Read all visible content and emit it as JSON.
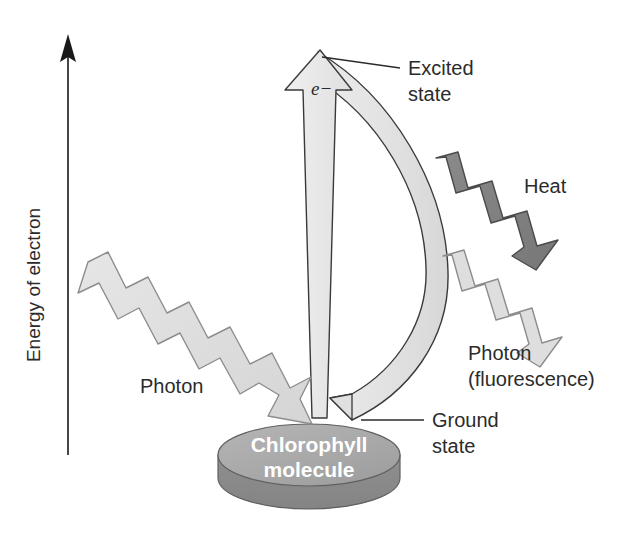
{
  "diagram": {
    "axis": {
      "label": "Energy of electron",
      "direction": "up",
      "arrow_icon": "arrow-up-icon"
    },
    "labels": {
      "excited_state_line1": "Excited",
      "excited_state_line2": "state",
      "ground_state_line1": "Ground",
      "ground_state_line2": "state",
      "heat": "Heat",
      "photon_in": "Photon",
      "photon_out_line1": "Photon",
      "photon_out_line2": "(fluorescence)",
      "electron": "e−"
    },
    "molecule": {
      "name_line1": "Chlorophyll",
      "name_line2": "molecule",
      "shape": "cylinder-disc"
    },
    "arrows": {
      "excitation": "up-arrow-excitation",
      "relaxation": "curved-arrow-relaxation",
      "photon_in": "zigzag-arrow-photon-absorbed",
      "heat": "zigzag-arrow-heat",
      "photon_out": "zigzag-arrow-photon-emitted"
    },
    "colors": {
      "light_fill": "#e3e3e3",
      "pale_fill": "#ededed",
      "mid_gray": "#a8a8a8",
      "dark_gray": "#828282",
      "disc_top": "#a9a9a9",
      "disc_side": "#8b8b8b",
      "outline": "#3a3a3a",
      "text": "#2b2b2b",
      "background": "#ffffff"
    }
  }
}
